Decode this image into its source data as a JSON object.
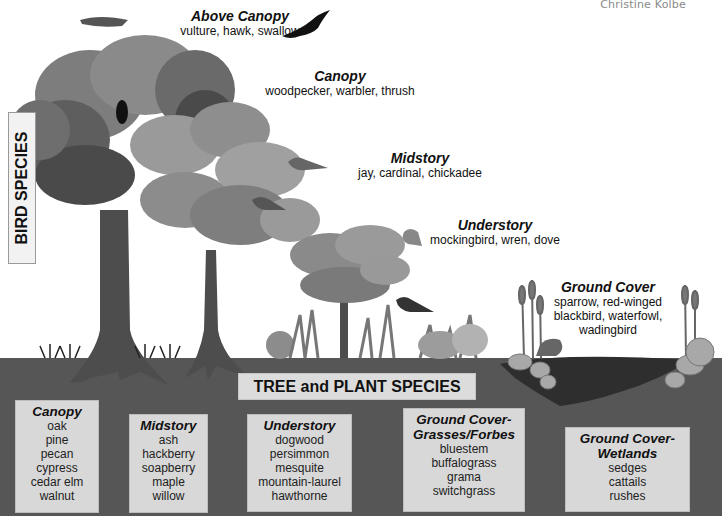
{
  "credit": "Christine Kolbe",
  "bird_species": {
    "label": "BIRD SPECIES",
    "zones": [
      {
        "title": "Above Canopy",
        "birds": "vulture, hawk, swallow"
      },
      {
        "title": "Canopy",
        "birds": "woodpecker, warbler, thrush"
      },
      {
        "title": "Midstory",
        "birds": "jay, cardinal, chickadee"
      },
      {
        "title": "Understory",
        "birds": "mockingbird, wren, dove"
      },
      {
        "title": "Ground Cover",
        "birds_lines": [
          "sparrow, red-winged",
          "blackbird, waterfowl,",
          "wadingbird"
        ]
      }
    ]
  },
  "plant_species": {
    "label": "TREE and PLANT SPECIES",
    "groups": [
      {
        "title_lines": [
          "Canopy"
        ],
        "items": [
          "oak",
          "pine",
          "pecan",
          "cypress",
          "cedar elm",
          "walnut"
        ]
      },
      {
        "title_lines": [
          "Midstory"
        ],
        "items": [
          "ash",
          "hackberry",
          "soapberry",
          "maple",
          "willow"
        ]
      },
      {
        "title_lines": [
          "Understory"
        ],
        "items": [
          "dogwood",
          "persimmon",
          "mesquite",
          "mountain-laurel",
          "hawthorne"
        ]
      },
      {
        "title_lines": [
          "Ground Cover-",
          "Grasses/Forbes"
        ],
        "items": [
          "bluestem",
          "buffalograss",
          "grama",
          "switchgrass"
        ]
      },
      {
        "title_lines": [
          "Ground Cover-",
          "Wetlands"
        ],
        "items": [
          "sedges",
          "cattails",
          "rushes"
        ]
      }
    ]
  },
  "colors": {
    "ground": "#555555",
    "label_box": "#d8d8d8",
    "canopy_dark": "#4a4a4a",
    "canopy_mid": "#7a7a7a",
    "canopy_light": "#9c9c9c",
    "text": "#111111"
  }
}
